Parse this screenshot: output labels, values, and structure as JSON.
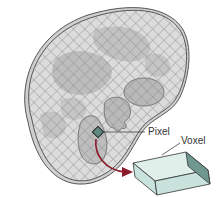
{
  "diagram": {
    "type": "ct-slice-pixel-voxel",
    "labels": {
      "pixel": "Pixel",
      "voxel": "Voxel"
    },
    "colors": {
      "slice_fill": "#dcdcdc",
      "slice_edge": "#555555",
      "grid_line": "#8a8a8a",
      "organ_fill": "#b4b4b4",
      "pixel_fill": "#5f8a80",
      "voxel_front": "#c9e3dc",
      "voxel_top": "#dff0eb",
      "voxel_end": "#6f9990",
      "arrow": "#8b1a2a"
    }
  }
}
